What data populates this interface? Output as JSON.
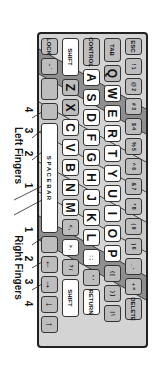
{
  "colors": {
    "keyboard_bg": "#d4d4d4",
    "key_gray": "#bdbdbd",
    "key_white": "#ffffff",
    "band_ring": "#8f8f8f",
    "band_index": "#c4c4c4",
    "outline": "#222222"
  },
  "keyboard": {
    "rows": [
      {
        "name": "number-row",
        "keys": [
          {
            "label": "ESC",
            "w": 17,
            "type": "wide"
          },
          {
            "label": "! 1",
            "type": "small"
          },
          {
            "label": "@ 2",
            "type": "small"
          },
          {
            "label": "# 3",
            "type": "small"
          },
          {
            "label": "$ 4",
            "type": "small"
          },
          {
            "label": "% 5",
            "type": "small"
          },
          {
            "label": "^ 6",
            "type": "small"
          },
          {
            "label": "& 7",
            "type": "small"
          },
          {
            "label": "* 8",
            "type": "small"
          },
          {
            "label": "( 9",
            "type": "small"
          },
          {
            "label": ") 0",
            "type": "small"
          },
          {
            "label": "_ -",
            "type": "small"
          },
          {
            "label": "+ =",
            "type": "small"
          },
          {
            "label": "DELETE",
            "w": 22,
            "type": "wide"
          }
        ]
      },
      {
        "name": "tab-row",
        "keys": [
          {
            "label": "TAB",
            "w": 24,
            "type": "wide"
          },
          {
            "label": "Q",
            "type": "letter"
          },
          {
            "label": "W",
            "type": "letter-white"
          },
          {
            "label": "E",
            "type": "letter-white"
          },
          {
            "label": "R",
            "type": "letter-white"
          },
          {
            "label": "T",
            "type": "letter-white"
          },
          {
            "label": "Y",
            "type": "letter-white"
          },
          {
            "label": "U",
            "type": "letter-white"
          },
          {
            "label": "I",
            "type": "letter-white"
          },
          {
            "label": "O",
            "type": "letter-white"
          },
          {
            "label": "P",
            "type": "letter-white"
          },
          {
            "label": "{ [",
            "type": "small"
          },
          {
            "label": "} ]",
            "type": "small"
          },
          {
            "label": "| \\",
            "type": "small"
          }
        ]
      },
      {
        "name": "home-row",
        "keys": [
          {
            "label": "CONTROL",
            "w": 28,
            "type": "wide"
          },
          {
            "label": "A",
            "type": "letter-white"
          },
          {
            "label": "S",
            "type": "letter-white"
          },
          {
            "label": "D",
            "type": "letter-white"
          },
          {
            "label": "F",
            "type": "letter-white"
          },
          {
            "label": "G",
            "type": "letter-white"
          },
          {
            "label": "H",
            "type": "letter-white"
          },
          {
            "label": "J",
            "type": "letter-white"
          },
          {
            "label": "K",
            "type": "letter-white"
          },
          {
            "label": "L",
            "type": "letter-white"
          },
          {
            "label": ": ;",
            "type": "small-white"
          },
          {
            "label": "\" '",
            "type": "small"
          },
          {
            "label": "RETURN",
            "w": 26,
            "type": "wide-white"
          }
        ]
      },
      {
        "name": "shift-row",
        "keys": [
          {
            "label": "SHIFT",
            "w": 38,
            "type": "wide-white"
          },
          {
            "label": "Z",
            "type": "letter"
          },
          {
            "label": "X",
            "type": "letter"
          },
          {
            "label": "C",
            "type": "letter-white"
          },
          {
            "label": "V",
            "type": "letter-white"
          },
          {
            "label": "B",
            "type": "letter-white"
          },
          {
            "label": "N",
            "type": "letter-white"
          },
          {
            "label": "M",
            "type": "letter-white"
          },
          {
            "label": "< ,",
            "type": "small"
          },
          {
            "label": "> .",
            "type": "small-white"
          },
          {
            "label": "? /",
            "type": "small"
          },
          {
            "label": "SHIFT",
            "w": 38,
            "type": "wide-white"
          }
        ]
      },
      {
        "name": "bottom-row",
        "keys": [
          {
            "label": "LOCK",
            "w": 17,
            "type": "wide"
          },
          {
            "label": "~ `",
            "type": "small"
          },
          {
            "label": "",
            "w": 22,
            "type": "blank"
          },
          {
            "label": "",
            "type": "blank"
          },
          {
            "label": "S P A C E   B A R",
            "w": 110,
            "type": "space"
          },
          {
            "label": "",
            "type": "blank"
          },
          {
            "label": "←",
            "type": "arrow"
          },
          {
            "label": "→",
            "type": "arrow"
          },
          {
            "label": "↓",
            "type": "arrow"
          },
          {
            "label": "↑",
            "type": "arrow"
          }
        ]
      }
    ]
  },
  "finger_labels": {
    "left_title": "Left Fingers",
    "right_title": "Right Fingers",
    "left_numbers": [
      "4",
      "3",
      "2",
      "1"
    ],
    "right_numbers": [
      "1",
      "2",
      "3",
      "4"
    ]
  }
}
